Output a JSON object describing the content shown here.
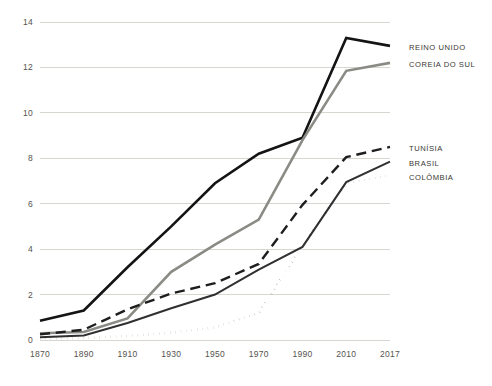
{
  "chart_data": {
    "type": "line",
    "title": "",
    "subtitle": "",
    "xlabel": "",
    "ylabel": "",
    "x": [
      1870,
      1890,
      1910,
      1930,
      1950,
      1970,
      1990,
      2010,
      2017
    ],
    "tick_labels_x": [
      "1870",
      "1890",
      "1910",
      "1930",
      "1950",
      "1970",
      "1990",
      "2010",
      "2017"
    ],
    "tick_labels_y": [
      "0",
      "2",
      "4",
      "6",
      "8",
      "10",
      "12",
      "14"
    ],
    "ticks_y": [
      0,
      2,
      4,
      6,
      8,
      10,
      12,
      14
    ],
    "ylim": [
      0,
      14
    ],
    "xlim": [
      1870,
      2017
    ],
    "grid": "horizontal",
    "legend_position": "right",
    "series": [
      {
        "name": "REINO UNIDO",
        "style": "solid",
        "color": "#141414",
        "width": 2.6,
        "values": [
          0.85,
          1.3,
          3.2,
          5.0,
          6.9,
          8.2,
          8.9,
          13.3,
          12.95
        ]
      },
      {
        "name": "COREIA DO SUL",
        "style": "solid",
        "color": "#8b8b86",
        "width": 2.6,
        "values": [
          0.3,
          0.35,
          0.95,
          3.0,
          4.2,
          5.3,
          8.8,
          11.85,
          12.2
        ]
      },
      {
        "name": "TUNÍSIA",
        "style": "dashed",
        "color": "#1e1e1e",
        "width": 2.4,
        "values": [
          0.25,
          0.45,
          1.35,
          2.05,
          2.5,
          3.35,
          5.95,
          8.05,
          8.5
        ]
      },
      {
        "name": "BRASIL",
        "style": "solid",
        "color": "#303030",
        "width": 2.0,
        "values": [
          0.12,
          0.2,
          0.75,
          1.4,
          2.0,
          3.1,
          4.1,
          6.95,
          7.85
        ]
      },
      {
        "name": "COLÔMBIA",
        "style": "dotted",
        "color": "#141414",
        "width": 2.6,
        "values": [
          0.05,
          0.08,
          0.18,
          0.32,
          0.55,
          1.2,
          4.15,
          6.9,
          7.25
        ]
      }
    ]
  },
  "legend": {
    "entries": [
      {
        "label": "REINO UNIDO"
      },
      {
        "label": "COREIA DO SUL"
      },
      {
        "label": "TUNÍSIA"
      },
      {
        "label": "BRASIL"
      },
      {
        "label": "COLÔMBIA"
      }
    ]
  }
}
